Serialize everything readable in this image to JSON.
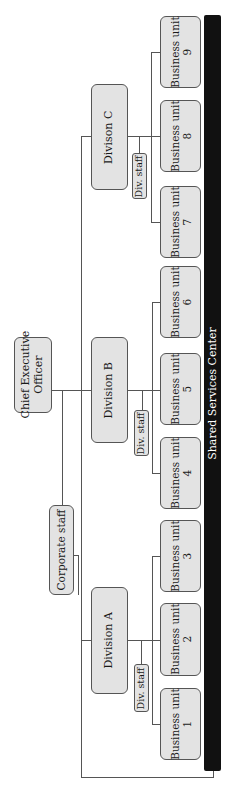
{
  "chart": {
    "orientation": "rotated-90-counterclockwise",
    "ceo": {
      "label": "Chief Executive\nOfficer",
      "line1": "Chief Executive",
      "line2": "Officer"
    },
    "corporate_staff": {
      "label": "Corporate staff"
    },
    "shared_services": {
      "label": "Shared Services Center"
    },
    "divisions": [
      {
        "label": "Division A",
        "staff": "Div. staff",
        "units": [
          "Business unit 1",
          "Business unit 2",
          "Business unit 3"
        ]
      },
      {
        "label": "Division B",
        "staff": "Div. staff",
        "units": [
          "Business unit 4",
          "Business unit 5",
          "Business unit 6"
        ]
      },
      {
        "label": "Divison C",
        "staff": "Div. staff",
        "units": [
          "Business unit 7",
          "Business unit 8",
          "Business unit 9"
        ]
      }
    ],
    "business_units": [
      {
        "l1": "Business unit",
        "l2": "1"
      },
      {
        "l1": "Business unit",
        "l2": "2"
      },
      {
        "l1": "Business unit",
        "l2": "3"
      },
      {
        "l1": "Business unit",
        "l2": "4"
      },
      {
        "l1": "Business unit",
        "l2": "5"
      },
      {
        "l1": "Business unit",
        "l2": "6"
      },
      {
        "l1": "Business unit",
        "l2": "7"
      },
      {
        "l1": "Business unit",
        "l2": "8"
      },
      {
        "l1": "Business unit",
        "l2": "9"
      }
    ],
    "colors": {
      "box_fill": "#e3e3e3",
      "box_border": "#555555",
      "bar": "#111111",
      "bar_text": "#ffffff"
    }
  }
}
